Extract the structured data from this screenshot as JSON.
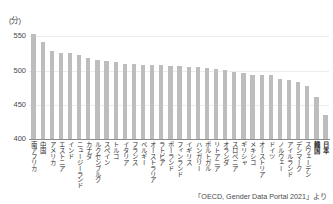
{
  "chart_data": {
    "type": "bar",
    "title": "",
    "subtitle": "",
    "xlabel": "",
    "ylabel": "(分)",
    "unit_label": "(分)",
    "ylim": [
      400,
      565
    ],
    "yticks": [
      400,
      450,
      500,
      550
    ],
    "ytick_labels": [
      "400",
      "450",
      "500",
      "550"
    ],
    "grid": true,
    "legend": null,
    "bar_color": "#bdbdbd",
    "categories": [
      "南アフリカ",
      "中国",
      "アメリカ",
      "エストニア",
      "インド",
      "ニュージーランド",
      "カナダ",
      "ルクセンブルク",
      "スペイン",
      "トルコ",
      "イタリア",
      "フランス",
      "ベルギー",
      "オーストラリア",
      "ラトビア",
      "ポーランド",
      "フィンランド",
      "イギリス",
      "ハンガリー",
      "ポルトガル",
      "リトアニア",
      "オランダ",
      "スロベニア",
      "ギリシャ",
      "メキシコ",
      "オーストリア",
      "ドイツ",
      "ノルウェー",
      "アイルランド",
      "デンマーク",
      "スウェーデン",
      "韓国",
      "日本"
    ],
    "values": [
      553,
      541,
      528,
      526,
      525,
      523,
      519,
      516,
      514,
      512,
      510,
      509,
      508,
      508,
      508,
      506,
      506,
      505,
      505,
      504,
      502,
      501,
      498,
      497,
      494,
      494,
      494,
      487,
      486,
      483,
      478,
      462,
      435
    ],
    "highlighted_categories": [
      "韓国",
      "日本"
    ]
  },
  "source_note": "「OECD, Gender Data Portal 2021」より"
}
